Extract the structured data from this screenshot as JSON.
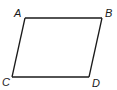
{
  "diagram": {
    "type": "parallelogram",
    "vertices": [
      {
        "id": "A",
        "label": "A"
      },
      {
        "id": "B",
        "label": "B"
      },
      {
        "id": "C",
        "label": "C"
      },
      {
        "id": "D",
        "label": "D"
      }
    ],
    "edges": [
      [
        "A",
        "B"
      ],
      [
        "B",
        "D"
      ],
      [
        "D",
        "C"
      ],
      [
        "C",
        "A"
      ]
    ],
    "colors": {
      "stroke": "#1a1a1a",
      "background": "#ffffff"
    }
  }
}
